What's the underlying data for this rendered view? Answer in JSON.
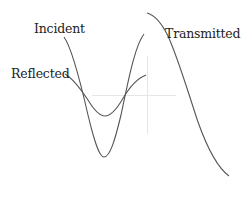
{
  "diagram": {
    "type": "wave reflection/transmission sketch",
    "labels": {
      "incident": "Incident",
      "reflected": "Reflected",
      "transmitted": "Transmitted"
    },
    "colors": {
      "curve": "#555555",
      "axis": "#e6e6e6",
      "text": "#222222",
      "background": "#ffffff"
    },
    "curves": [
      {
        "name": "Incident",
        "description": "large-amplitude wave on left side, trough near bottom"
      },
      {
        "name": "Reflected",
        "description": "smaller-amplitude wave on left side, shallow trough"
      },
      {
        "name": "Transmitted",
        "description": "wave continuing on right side, crest at top descending to lower right"
      }
    ]
  }
}
